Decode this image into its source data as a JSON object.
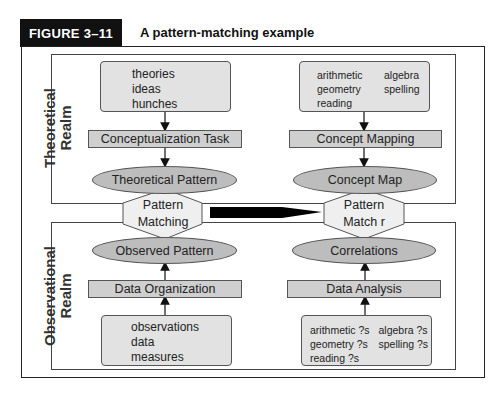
{
  "figure": {
    "number": "FIGURE 3–11",
    "title": "A pattern-matching example"
  },
  "realms": {
    "theoretical": "Theoretical\nRealm",
    "theoretical_line1": "Theoretical",
    "theoretical_line2": "Realm",
    "observational_line1": "Observational",
    "observational_line2": "Realm"
  },
  "left_column": {
    "top_box_items": [
      "theories",
      "ideas",
      "hunches"
    ],
    "top_task": "Conceptualization Task",
    "top_ellipse": "Theoretical Pattern",
    "hexagon_line1": "Pattern",
    "hexagon_line2": "Matching",
    "bottom_ellipse": "Observed Pattern",
    "bottom_task": "Data Organization",
    "bottom_box_items": [
      "observations",
      "data",
      "measures"
    ]
  },
  "right_column": {
    "top_box_items": [
      "arithmetic",
      "algebra",
      "geometry",
      "spelling",
      "reading"
    ],
    "top_task": "Concept Mapping",
    "top_ellipse": "Concept Map",
    "hexagon_line1": "Pattern",
    "hexagon_line2": "Match r",
    "bottom_ellipse": "Correlations",
    "bottom_task": "Data Analysis",
    "bottom_box_items": [
      "arithmetic ?s",
      "algebra ?s",
      "geometry ?s",
      "spelling ?s",
      "reading ?s"
    ]
  },
  "colors": {
    "box_fill": "#e2e2e2",
    "bar_fill": "#cfcfcf",
    "ellipse_fill": "#bdbdbd",
    "hexagon_fill": "#efefef",
    "arrow": "#000000"
  }
}
